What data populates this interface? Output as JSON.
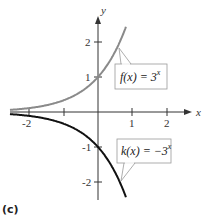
{
  "panel_label": "(c)",
  "chart_data": {
    "type": "line",
    "title": "",
    "xlabel": "x",
    "ylabel": "y",
    "xlim": [
      -2.8,
      2.6
    ],
    "ylim": [
      -2.5,
      2.5
    ],
    "grid": false,
    "x_ticks": [
      -2,
      -1,
      0,
      1,
      2
    ],
    "x_tick_labels": [
      "-2",
      "",
      "",
      "1",
      "2"
    ],
    "y_ticks": [
      -2,
      -1,
      1,
      2
    ],
    "y_tick_labels": [
      "-2",
      "-1",
      "1",
      "2"
    ],
    "series": [
      {
        "name": "f(x) = 3^x",
        "label_text": "f(x) = 3",
        "label_exponent": "x",
        "color": "#8a8a8a",
        "x": [
          -2.8,
          -2,
          -1.5,
          -1,
          -0.5,
          0,
          0.3,
          0.6,
          0.8
        ],
        "y": [
          0.046,
          0.111,
          0.192,
          0.333,
          0.577,
          1.0,
          1.39,
          1.93,
          2.41
        ]
      },
      {
        "name": "k(x) = -3^x",
        "label_text": "k(x) = −3",
        "label_exponent": "x",
        "color": "#111111",
        "x": [
          -2.8,
          -2,
          -1.5,
          -1,
          -0.5,
          0,
          0.3,
          0.6,
          0.8
        ],
        "y": [
          -0.046,
          -0.111,
          -0.192,
          -0.333,
          -0.577,
          -1.0,
          -1.39,
          -1.93,
          -2.41
        ]
      }
    ],
    "annotations": [
      {
        "text": "f(x) = 3^x",
        "points_to": [
          0.6,
          1.93
        ]
      },
      {
        "text": "k(x) = -3^x",
        "points_to": [
          0.66,
          -2.06
        ]
      }
    ]
  }
}
